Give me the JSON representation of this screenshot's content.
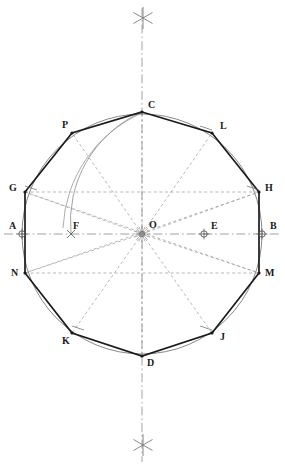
{
  "figure": {
    "type": "geometric-construction",
    "canvas": {
      "width": 285,
      "height": 471
    },
    "colors": {
      "polygon": "#1a1a1a",
      "circle": "#7a7a7a",
      "construction": "#9a9a9a",
      "centerline": "#8a8a8a",
      "arc": "#8a8a8a",
      "label": "#1a1a1a",
      "background": "#ffffff"
    },
    "circle": {
      "cx": 142,
      "cy": 234,
      "r": 120
    },
    "center_label": "O",
    "axes": {
      "vertical": {
        "x": 142,
        "y1": 8,
        "y2": 462
      },
      "horizontal": {
        "y": 234,
        "x1": 4,
        "x2": 281
      }
    },
    "cross_marks": [
      {
        "name": "top-bisector-cross",
        "x": 143,
        "y": 18
      },
      {
        "name": "bottom-bisector-cross",
        "x": 143,
        "y": 445
      }
    ],
    "points": [
      {
        "id": "A",
        "label": "A",
        "x": 22,
        "y": 234,
        "lx": 9,
        "ly": 221,
        "marker": "circle-cross"
      },
      {
        "id": "B",
        "label": "B",
        "x": 262,
        "y": 234,
        "lx": 270,
        "ly": 221,
        "marker": "circle-cross"
      },
      {
        "id": "C",
        "label": "C",
        "x": 142,
        "y": 112,
        "lx": 148,
        "ly": 100,
        "marker": "vertex"
      },
      {
        "id": "D",
        "label": "D",
        "x": 142,
        "y": 356,
        "lx": 147,
        "ly": 358,
        "marker": "vertex"
      },
      {
        "id": "E",
        "label": "E",
        "x": 204,
        "y": 234,
        "lx": 211,
        "ly": 221,
        "marker": "circle-cross"
      },
      {
        "id": "F",
        "label": "F",
        "x": 71,
        "y": 234,
        "lx": 73,
        "ly": 221,
        "marker": "tick"
      },
      {
        "id": "G",
        "label": "G",
        "x": 25,
        "y": 192,
        "lx": 9,
        "ly": 183,
        "marker": "vertex"
      },
      {
        "id": "H",
        "label": "H",
        "x": 259,
        "y": 192,
        "lx": 265,
        "ly": 183,
        "marker": "vertex"
      },
      {
        "id": "J",
        "label": "J",
        "x": 212,
        "y": 333,
        "lx": 220,
        "ly": 332,
        "marker": "vertex"
      },
      {
        "id": "K",
        "label": "K",
        "x": 72,
        "y": 333,
        "lx": 62,
        "ly": 336,
        "marker": "vertex"
      },
      {
        "id": "L",
        "label": "L",
        "x": 212,
        "y": 133,
        "lx": 220,
        "ly": 121,
        "marker": "vertex"
      },
      {
        "id": "M",
        "label": "M",
        "x": 259,
        "y": 273,
        "lx": 265,
        "ly": 268,
        "marker": "vertex"
      },
      {
        "id": "N",
        "label": "N",
        "x": 25,
        "y": 273,
        "lx": 11,
        "ly": 268,
        "marker": "vertex"
      },
      {
        "id": "P",
        "label": "P",
        "x": 72,
        "y": 133,
        "lx": 62,
        "ly": 120,
        "marker": "vertex"
      }
    ],
    "polygon": {
      "name": "decagon",
      "sides": 10,
      "vertex_order": [
        "C",
        "L",
        "H",
        "M",
        "J",
        "D",
        "K",
        "N",
        "G",
        "P"
      ],
      "path": "142,112 212,133 259,192 259,273 212,333 142,356 72,333 25,273 25,192 72,133"
    },
    "construction_lines": [
      {
        "name": "radius-O-C",
        "from": "O",
        "to": "C"
      },
      {
        "name": "radius-O-L",
        "from": "O",
        "to": "L"
      },
      {
        "name": "radius-O-H",
        "from": "O",
        "to": "H"
      },
      {
        "name": "radius-O-M",
        "from": "O",
        "to": "M"
      },
      {
        "name": "radius-O-J",
        "from": "O",
        "to": "J"
      },
      {
        "name": "radius-O-D",
        "from": "O",
        "to": "D"
      },
      {
        "name": "radius-O-K",
        "from": "O",
        "to": "K"
      },
      {
        "name": "radius-O-N",
        "from": "O",
        "to": "N"
      },
      {
        "name": "radius-O-G",
        "from": "O",
        "to": "G"
      },
      {
        "name": "radius-O-P",
        "from": "O",
        "to": "P"
      }
    ],
    "arcs": [
      {
        "name": "arc-C-to-F",
        "description": "arc centred on B through C down to F on the horizontal axis"
      },
      {
        "name": "arc-E-to-F",
        "description": "arc centred on E with radius EC meeting axis at F"
      }
    ],
    "notes": {
      "caption": ""
    }
  }
}
